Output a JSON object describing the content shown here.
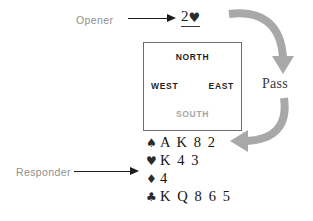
{
  "diagram": {
    "accent_gray": "#a8a8a8",
    "label_gray": "#8f8f8f",
    "ink": "#1b1b1b"
  },
  "labels": {
    "opener": "Opener",
    "responder": "Responder"
  },
  "bid": {
    "level": "2",
    "suit_symbol": "♥",
    "suit_name": "hearts",
    "full_text": "2♥",
    "underlined": true
  },
  "compass": {
    "north": "NORTH",
    "west": "WEST",
    "east": "EAST",
    "south": "SOUTH"
  },
  "pass": {
    "label": "Pass"
  },
  "hand": {
    "rows": [
      {
        "suit_symbol": "♠",
        "suit_name": "spades",
        "cards": "A K 8 2"
      },
      {
        "suit_symbol": "♥",
        "suit_name": "hearts",
        "cards": "K 4 3"
      },
      {
        "suit_symbol": "♦",
        "suit_name": "diamonds",
        "cards": "4"
      },
      {
        "suit_symbol": "♣",
        "suit_name": "clubs",
        "cards": "K Q 8 6 5"
      }
    ]
  }
}
